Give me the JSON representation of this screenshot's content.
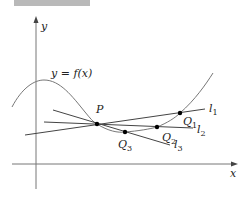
{
  "figure": {
    "header_strip_color": "#b9b9b9",
    "axis_color": "#777777",
    "curve_color": "#777777",
    "line_color": "#444444",
    "point_color": "#000000"
  },
  "axes": {
    "x_label": "x",
    "y_label": "y"
  },
  "curve": {
    "label": "y = f(x)"
  },
  "points": {
    "P": {
      "label": "P",
      "x": 97,
      "y": 124
    },
    "Q1": {
      "label": "Q",
      "sub": "1",
      "x": 180,
      "y": 113
    },
    "Q2": {
      "label": "Q",
      "sub": "2",
      "x": 157,
      "y": 127
    },
    "Q3": {
      "label": "Q",
      "sub": "3",
      "x": 125,
      "y": 132
    }
  },
  "lines": {
    "l1": {
      "label": "l",
      "sub": "1"
    },
    "l2": {
      "label": "l",
      "sub": "2"
    },
    "l3": {
      "label": "l",
      "sub": "3"
    }
  }
}
